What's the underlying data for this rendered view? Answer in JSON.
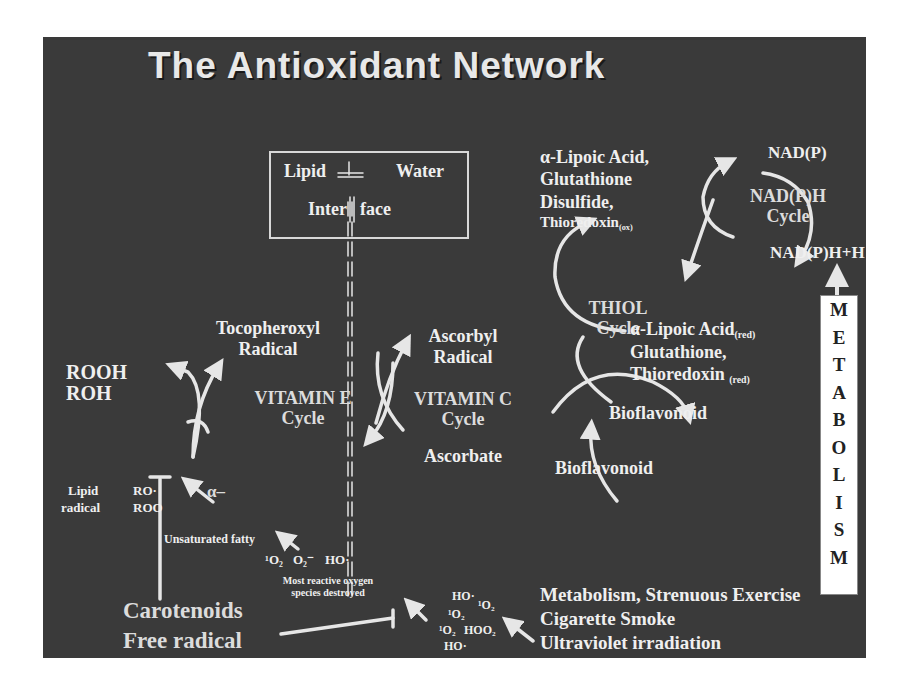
{
  "title": "The Antioxidant Network",
  "interface_box": {
    "left": "Lipid",
    "right": "Water",
    "bottom_left": "Inter",
    "bottom_right": "face"
  },
  "vitamin_e": {
    "product": [
      "Tocopheroxyl",
      "Radical"
    ],
    "label": [
      "VITAMIN E",
      "Cycle"
    ],
    "alpha": "α–"
  },
  "lipid_products": [
    "ROOH",
    "ROH"
  ],
  "lipid_radical": {
    "label": [
      "Lipid",
      "radical"
    ],
    "species": [
      "RO·",
      "ROO"
    ]
  },
  "unsaturated": "Unsaturated fatty",
  "vitamin_c": {
    "product": [
      "Ascorbyl",
      "Radical"
    ],
    "label": [
      "VITAMIN C",
      "Cycle"
    ],
    "reduced": "Ascorbate"
  },
  "thiol": {
    "oxidized": [
      "α-Lipoic Acid,",
      "Glutathione",
      "Disulfide,",
      "Thioredoxin"
    ],
    "oxidized_sub": "(ox)",
    "label": [
      "THIOL",
      "Cycle"
    ],
    "reduced_line1": "α-Lipoic Acid",
    "reduced_line1_sub": "(red)",
    "reduced_line2": "Glutathione,",
    "reduced_line3": "Thioredoxin",
    "reduced_line3_sub": "(red)"
  },
  "nadph": {
    "top": "NAD(P)",
    "label": [
      "NAD(P)H",
      "Cycle"
    ],
    "bottom": "NAD(P)H+H"
  },
  "bioflavonoid": {
    "right": "Bioflavonoid",
    "bottom": "Bioflavonoid"
  },
  "metabolism_letters": [
    "M",
    "E",
    "T",
    "A",
    "B",
    "O",
    "L",
    "I",
    "S",
    "M"
  ],
  "ros_destroyed": {
    "species": [
      "¹O₂",
      "O₂⁻",
      "HO·"
    ],
    "caption": [
      "Most reactive oxygen",
      "species destroyed"
    ]
  },
  "ros_cluster": [
    "HO·",
    "¹O₂",
    "¹O₂",
    "¹O₂",
    "HOO₂",
    "HO·"
  ],
  "sources": [
    "Metabolism, Strenuous Exercise",
    "Cigarette Smoke",
    "Ultraviolet irradiation"
  ],
  "carotenoids": [
    "Carotenoids",
    "Free radical"
  ],
  "colors": {
    "background": "#3a3a3a",
    "text": "#efefef",
    "arrow": "#e6e6e6",
    "metabolism_box": "#ffffff"
  }
}
